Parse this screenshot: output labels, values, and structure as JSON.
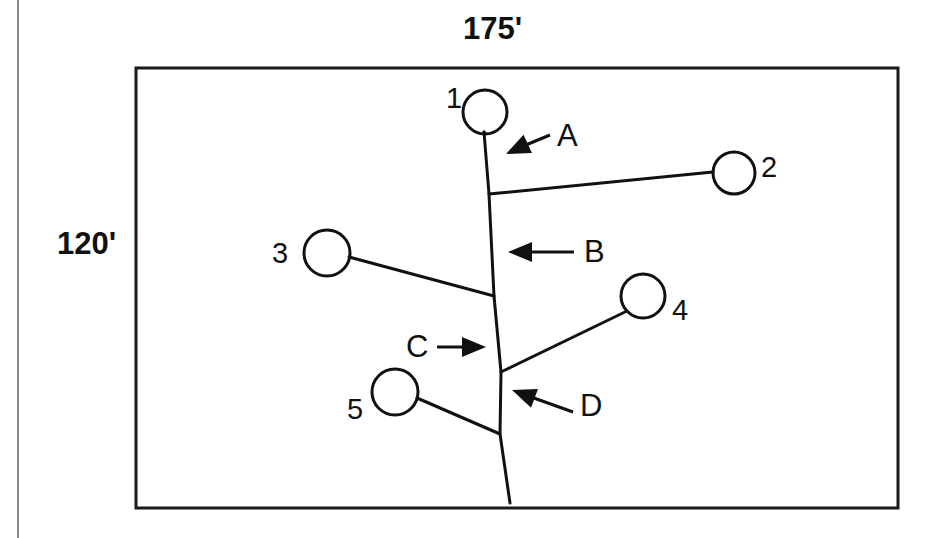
{
  "diagram": {
    "title_context": "tree planting plan diagram",
    "dimensions": {
      "top_label": "175'",
      "left_label": "120'"
    },
    "plot": {
      "x": 136,
      "y": 68,
      "width": 762,
      "height": 440,
      "border_color": "#1a1a1a"
    },
    "stem": {
      "name": "main-stem",
      "points": "484,132 489,194 494,296 501,372 500,434 510,503",
      "color": "#111111"
    },
    "crowns": [
      {
        "id": "crown-1",
        "label": "1",
        "cx": 485,
        "cy": 112,
        "r": 22,
        "label_x": 446,
        "label_y": 108
      },
      {
        "id": "crown-2",
        "label": "2",
        "cx": 734,
        "cy": 173,
        "r": 21,
        "label_x": 761,
        "label_y": 177
      },
      {
        "id": "crown-3",
        "label": "3",
        "cx": 327,
        "cy": 253,
        "r": 23,
        "label_x": 272,
        "label_y": 263
      },
      {
        "id": "crown-4",
        "label": "4",
        "cx": 643,
        "cy": 296,
        "r": 22,
        "label_x": 672,
        "label_y": 320
      },
      {
        "id": "crown-5",
        "label": "5",
        "cx": 395,
        "cy": 392,
        "r": 23,
        "label_x": 347,
        "label_y": 419
      }
    ],
    "branches": [
      {
        "id": "branch-to-crown-1",
        "x1": 485,
        "y1": 134,
        "x2": 484,
        "y2": 132
      },
      {
        "id": "branch-to-crown-2",
        "x1": 489,
        "y1": 194,
        "x2": 713,
        "y2": 172
      },
      {
        "id": "branch-to-crown-3",
        "x1": 494,
        "y1": 296,
        "x2": 349,
        "y2": 257
      },
      {
        "id": "branch-to-crown-4",
        "x1": 501,
        "y1": 372,
        "x2": 627,
        "y2": 311
      },
      {
        "id": "branch-to-crown-5",
        "x1": 500,
        "y1": 434,
        "x2": 417,
        "y2": 398
      }
    ],
    "callouts": [
      {
        "id": "callout-a",
        "label": "A",
        "label_x": 557,
        "label_y": 146,
        "line_x1": 550,
        "line_y1": 135,
        "line_x2": 521,
        "line_y2": 147,
        "tip_x": 506,
        "tip_y": 154,
        "direction": "down-left"
      },
      {
        "id": "callout-b",
        "label": "B",
        "label_x": 584,
        "label_y": 262,
        "line_x1": 574,
        "line_y1": 252,
        "line_x2": 527,
        "line_y2": 252,
        "tip_x": 508,
        "tip_y": 252,
        "direction": "left"
      },
      {
        "id": "callout-c",
        "label": "C",
        "label_x": 406,
        "label_y": 357,
        "line_x1": 437,
        "line_y1": 347,
        "line_x2": 467,
        "line_y2": 347,
        "tip_x": 486,
        "tip_y": 347,
        "direction": "right"
      },
      {
        "id": "callout-d",
        "label": "D",
        "label_x": 580,
        "label_y": 416,
        "line_x1": 573,
        "line_y1": 412,
        "line_x2": 531,
        "line_y2": 397,
        "tip_x": 512,
        "tip_y": 390,
        "direction": "up-left"
      }
    ]
  }
}
